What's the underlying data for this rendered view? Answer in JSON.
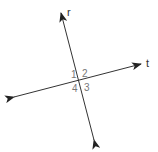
{
  "diagram": {
    "type": "intersecting-lines",
    "colors": {
      "line": "#333333",
      "line_label": "#333333",
      "angle_label": "#777777",
      "background": "#ffffff"
    },
    "lines": [
      {
        "name": "r",
        "label": "r",
        "start": [
          94,
          140
        ],
        "end": [
          61,
          13
        ],
        "label_pos": [
          67,
          16
        ]
      },
      {
        "name": "t",
        "label": "t",
        "start": [
          14,
          97
        ],
        "end": [
          141,
          64
        ],
        "label_pos": [
          146,
          67
        ]
      }
    ],
    "intersection": [
      79,
      81
    ],
    "angles": [
      {
        "label": "1",
        "pos": [
          71,
          78
        ]
      },
      {
        "label": "2",
        "pos": [
          82,
          77
        ]
      },
      {
        "label": "3",
        "pos": [
          84,
          91
        ]
      },
      {
        "label": "4",
        "pos": [
          72,
          92
        ]
      }
    ]
  }
}
